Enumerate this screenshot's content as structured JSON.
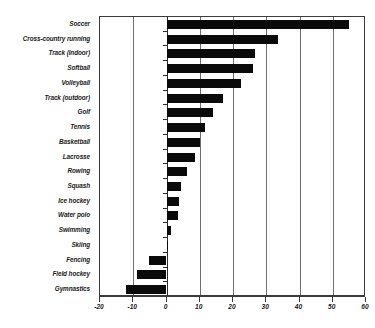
{
  "chart_data": {
    "type": "bar",
    "orientation": "horizontal",
    "title": "",
    "subtitle": "",
    "xlabel": "",
    "ylabel": "",
    "xlim": [
      -20,
      60
    ],
    "ylim": [
      0,
      19
    ],
    "grid": true,
    "legend": false,
    "legend_position": "none",
    "xticks": [
      "-20",
      "-10",
      "0",
      "10",
      "20",
      "30",
      "40",
      "50",
      "60"
    ],
    "xtick_values": [
      -20,
      -10,
      0,
      10,
      20,
      30,
      40,
      50,
      60
    ],
    "bar_color": "#0a0a0a",
    "axis_color": "#3a3a3a",
    "grid_color": "#6e6e6e",
    "categories": [
      "Soccer",
      "Cross-country running",
      "Track (indoor)",
      "Softball",
      "Volleyball",
      "Track (outdoor)",
      "Golf",
      "Tennis",
      "Basketball",
      "Lacrosse",
      "Rowing",
      "Squash",
      "Ice hockey",
      "Water polo",
      "Swimming",
      "Skiing",
      "Fencing",
      "Field hockey",
      "Gymnastics"
    ],
    "values": [
      55,
      33.5,
      26.5,
      26,
      22.5,
      17,
      14,
      11.5,
      10,
      8.5,
      6.3,
      4.5,
      3.7,
      3.4,
      1.4,
      0.3,
      -5.4,
      -8.9,
      -12.3
    ]
  }
}
